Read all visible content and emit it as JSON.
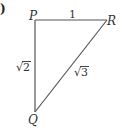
{
  "figure": {
    "partial_label": ")",
    "vertices": {
      "P": {
        "label": "P",
        "x": 35,
        "y": 20
      },
      "R": {
        "label": "R",
        "x": 107,
        "y": 20
      },
      "Q": {
        "label": "Q",
        "x": 35,
        "y": 112
      }
    },
    "sides": {
      "PR": {
        "label": "1"
      },
      "PQ": {
        "radicand": "2",
        "label": "√2"
      },
      "QR": {
        "radicand": "3",
        "label": "√3"
      }
    },
    "stroke_color": "#555555",
    "text_color": "#333333"
  }
}
